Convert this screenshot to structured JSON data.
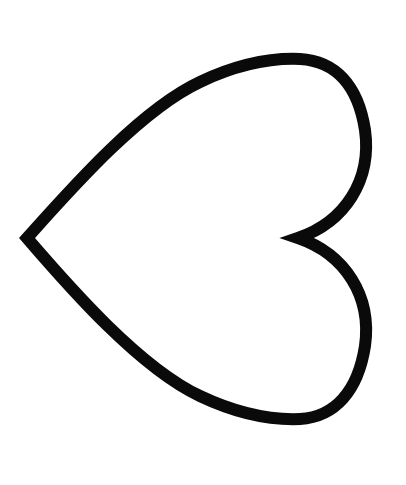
{
  "image": {
    "subject": "heart outline",
    "orientation": "rotated 90 degrees, point facing left",
    "background_color": "#ffffff",
    "stroke_color": "#0a0a0a",
    "fill_color": "#ffffff",
    "stroke_width": 12
  }
}
